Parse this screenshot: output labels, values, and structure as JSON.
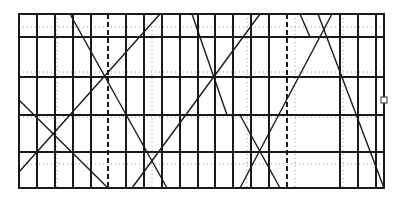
{
  "diagram": {
    "type": "grid-with-diagonals",
    "frame": {
      "x1": 19,
      "y1": 14,
      "x2": 384,
      "y2": 188
    },
    "colors": {
      "line": "#1a1a1a",
      "dotted": "#9a9a9a",
      "background": "#ffffff",
      "handle_fill": "#ffffff",
      "handle_stroke": "#333333"
    },
    "vertical_solid": [
      37,
      55,
      73,
      91,
      126,
      144,
      162,
      180,
      198,
      215,
      233,
      251,
      269,
      340,
      358,
      376
    ],
    "vertical_dashed": [
      108,
      287
    ],
    "vertical_dotted": [
      57,
      152,
      247,
      295,
      343
    ],
    "horizontal_solid": [
      37,
      77,
      115,
      152
    ],
    "horizontal_dotted": [
      27,
      72,
      117,
      164
    ],
    "diagonals": [
      {
        "x1": 70,
        "y1": 14,
        "x2": 167,
        "y2": 188
      },
      {
        "x1": 160,
        "y1": 14,
        "x2": 19,
        "y2": 172
      },
      {
        "x1": 19,
        "y1": 100,
        "x2": 108,
        "y2": 188
      },
      {
        "x1": 132,
        "y1": 188,
        "x2": 260,
        "y2": 14
      },
      {
        "x1": 192,
        "y1": 14,
        "x2": 227,
        "y2": 115
      },
      {
        "x1": 240,
        "y1": 115,
        "x2": 280,
        "y2": 188
      },
      {
        "x1": 332,
        "y1": 14,
        "x2": 240,
        "y2": 188
      },
      {
        "x1": 300,
        "y1": 14,
        "x2": 310,
        "y2": 37
      },
      {
        "x1": 318,
        "y1": 14,
        "x2": 384,
        "y2": 188
      }
    ],
    "resize_handle": {
      "x": 384,
      "y": 100,
      "size": 6
    }
  }
}
